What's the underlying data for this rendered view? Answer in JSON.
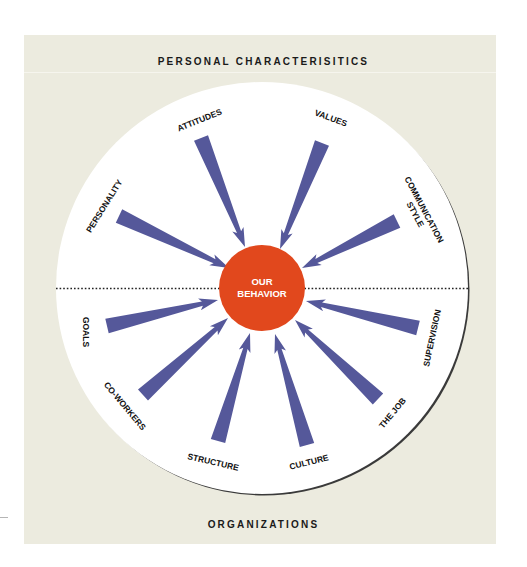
{
  "diagram": {
    "top_heading": "PERSONAL CHARACTERISITICS",
    "bottom_heading": "ORGANIZATIONS",
    "center": {
      "line1": "OUR",
      "line2": "BEHAVIOR",
      "color": "#e1481d"
    },
    "colors": {
      "background_panel": "#ecebdf",
      "wheel": "#ffffff",
      "arrow": "#55589a",
      "divider": "#222222"
    },
    "top_half_label": "Personal characteristics",
    "bottom_half_label": "Organizations",
    "influences": [
      {
        "id": "personality",
        "label": "PERSONALITY",
        "group": "personal",
        "tail": [
          119,
          216
        ],
        "tip": [
          229,
          268
        ],
        "label_pos": [
          104,
          206
        ],
        "label_rot": -58
      },
      {
        "id": "attitudes",
        "label": "ATTITUDES",
        "group": "personal",
        "tail": [
          201,
          138
        ],
        "tip": [
          245,
          247
        ],
        "label_pos": [
          199,
          120
        ],
        "label_rot": -22
      },
      {
        "id": "values",
        "label": "VALUES",
        "group": "personal",
        "tail": [
          322,
          143
        ],
        "tip": [
          280,
          249
        ],
        "label_pos": [
          331,
          118
        ],
        "label_rot": 20
      },
      {
        "id": "communication-style",
        "label": "COMMUNICATION",
        "label2": "STYLE",
        "group": "personal",
        "tail": [
          397,
          221
        ],
        "tip": [
          302,
          268
        ],
        "label_pos": [
          420,
          212
        ],
        "label_rot": 62
      },
      {
        "id": "goals",
        "label": "GOALS",
        "group": "organization",
        "tail": [
          107,
          326
        ],
        "tip": [
          218,
          300
        ],
        "label_pos": [
          86,
          332
        ],
        "label_rot": 90
      },
      {
        "id": "co-workers",
        "label": "CO-WORKERS",
        "group": "organization",
        "tail": [
          143,
          395
        ],
        "tip": [
          228,
          318
        ],
        "label_pos": [
          125,
          406
        ],
        "label_rot": 50
      },
      {
        "id": "structure",
        "label": "STRUCTURE",
        "group": "organization",
        "tail": [
          218,
          441
        ],
        "tip": [
          250,
          333
        ],
        "label_pos": [
          213,
          462
        ],
        "label_rot": 13
      },
      {
        "id": "culture",
        "label": "CULTURE",
        "group": "organization",
        "tail": [
          307,
          445
        ],
        "tip": [
          275,
          334
        ],
        "label_pos": [
          309,
          462
        ],
        "label_rot": -14
      },
      {
        "id": "the-job",
        "label": "THE JOB",
        "group": "organization",
        "tail": [
          378,
          399
        ],
        "tip": [
          295,
          320
        ],
        "label_pos": [
          392,
          413
        ],
        "label_rot": -50
      },
      {
        "id": "supervision",
        "label": "SUPERVISION",
        "group": "organization",
        "tail": [
          418,
          328
        ],
        "tip": [
          306,
          301
        ],
        "label_pos": [
          432,
          338
        ],
        "label_rot": -78
      }
    ]
  }
}
